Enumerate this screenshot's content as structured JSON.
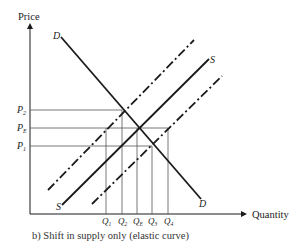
{
  "diagram": {
    "y_axis_label": "Price",
    "x_axis_label": "Quantity",
    "caption": "b) Shift in supply only (elastic curve)",
    "curves": {
      "demand": {
        "label_top": "D",
        "label_bottom": "D"
      },
      "supply": {
        "label_top": "S",
        "label_bottom": "S"
      },
      "supply_decrease": {
        "style": "dash-dot"
      },
      "supply_increase": {
        "style": "dash-dot"
      }
    },
    "price_levels": [
      {
        "label": "P",
        "sub": "2"
      },
      {
        "label": "P",
        "sub": "E"
      },
      {
        "label": "P",
        "sub": "1"
      }
    ],
    "quantity_levels": [
      {
        "label": "Q",
        "sub": "1"
      },
      {
        "label": "Q",
        "sub": "2"
      },
      {
        "label": "Q",
        "sub": "E"
      },
      {
        "label": "Q",
        "sub": "3"
      },
      {
        "label": "Q",
        "sub": "4"
      }
    ],
    "colors": {
      "line": "#1a1a1a",
      "guide": "#555555"
    }
  }
}
